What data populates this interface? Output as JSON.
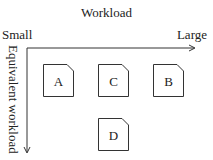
{
  "diagram": {
    "title": "Workload",
    "x_axis": {
      "left_label": "Small",
      "right_label": "Large"
    },
    "y_axis": {
      "label": "Equivalent workload"
    },
    "nodes": [
      {
        "id": "A",
        "label": "A",
        "x": 43,
        "y": 64
      },
      {
        "id": "C",
        "label": "C",
        "x": 98,
        "y": 64
      },
      {
        "id": "B",
        "label": "B",
        "x": 153,
        "y": 64
      },
      {
        "id": "D",
        "label": "D",
        "x": 98,
        "y": 118
      }
    ]
  }
}
